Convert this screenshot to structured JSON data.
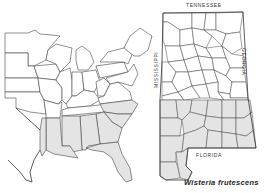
{
  "figure": {
    "caption": "Wisteria frutescens",
    "type": "species range map"
  },
  "maps": {
    "us_map": {
      "region": "Eastern United States",
      "shaded_states": [
        "Texas (east)",
        "Louisiana",
        "Mississippi",
        "Alabama",
        "Georgia",
        "South Carolina",
        "North Carolina",
        "Florida"
      ]
    },
    "alabama_map": {
      "labels": {
        "north": "TENNESSEE",
        "east": "GEORGIA",
        "west": "MISSISSIPPI",
        "south": "FLORIDA"
      },
      "shading": "southern counties shaded"
    }
  },
  "colors": {
    "shade": "#e4e4e4",
    "line": "#444444",
    "background": "#ffffff"
  }
}
